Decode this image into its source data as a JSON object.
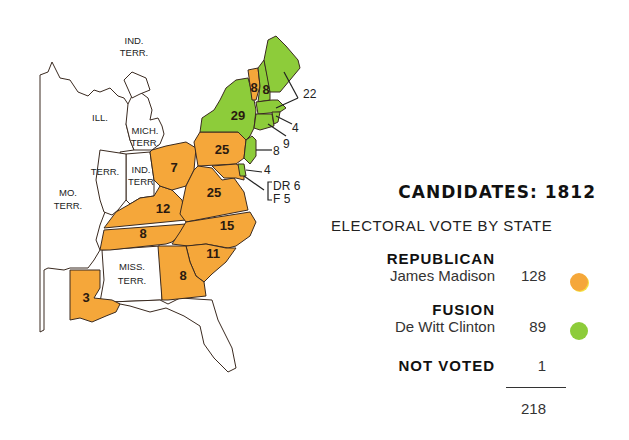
{
  "legend": {
    "title": "CANDIDATES: 1812",
    "subtitle": "ELECTORAL VOTE BY STATE",
    "entries": [
      {
        "party": "REPUBLICAN",
        "candidate": "James Madison",
        "votes": "128",
        "color": "#f5a73a"
      },
      {
        "party": "FUSION",
        "candidate": "De Witt Clinton",
        "votes": "89",
        "color": "#8dcc3a"
      },
      {
        "party": "NOT VOTED",
        "candidate": "",
        "votes": "1",
        "color": ""
      }
    ],
    "total": "218"
  },
  "map": {
    "colors": {
      "republican": "#f5a73a",
      "fusion": "#8dcc3a",
      "territory": "#ffffff",
      "border": "#3a2a20"
    },
    "territories": [
      {
        "label1": "IND.",
        "label2": "TERR."
      },
      {
        "label1": "ILL.",
        "label2": ""
      },
      {
        "label1": "MICH.",
        "label2": "TERR."
      },
      {
        "label1": "TERR.",
        "label2": ""
      },
      {
        "label1": "IND.",
        "label2": "TERR"
      },
      {
        "label1": "MO.",
        "label2": "TERR."
      },
      {
        "label1": "MISS.",
        "label2": "TERR."
      }
    ],
    "states": [
      {
        "name": "Louisiana",
        "votes": "3",
        "party": "republican"
      },
      {
        "name": "Ohio",
        "votes": "7",
        "party": "republican"
      },
      {
        "name": "Kentucky",
        "votes": "12",
        "party": "republican"
      },
      {
        "name": "Tennessee",
        "votes": "8",
        "party": "republican"
      },
      {
        "name": "Virginia",
        "votes": "25",
        "party": "republican"
      },
      {
        "name": "Pennsylvania",
        "votes": "25",
        "party": "republican"
      },
      {
        "name": "North Carolina",
        "votes": "15",
        "party": "republican"
      },
      {
        "name": "South Carolina",
        "votes": "11",
        "party": "republican"
      },
      {
        "name": "Georgia",
        "votes": "8",
        "party": "republican"
      },
      {
        "name": "Vermont",
        "votes": "8",
        "party": "republican"
      },
      {
        "name": "New York",
        "votes": "29",
        "party": "fusion"
      },
      {
        "name": "New Hampshire",
        "votes": "8",
        "party": "fusion"
      },
      {
        "name": "Massachusetts",
        "votes": "22",
        "party": "fusion"
      },
      {
        "name": "Rhode Island",
        "votes": "4",
        "party": "fusion"
      },
      {
        "name": "Connecticut",
        "votes": "9",
        "party": "fusion"
      },
      {
        "name": "New Jersey",
        "votes": "8",
        "party": "fusion"
      },
      {
        "name": "Delaware",
        "votes": "4",
        "party": "fusion"
      }
    ],
    "maryland": {
      "line1": "DR 6",
      "line2": "F  5"
    }
  }
}
